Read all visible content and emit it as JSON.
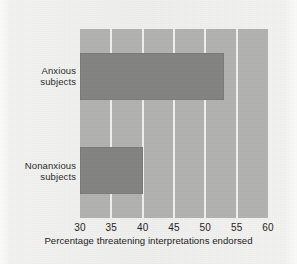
{
  "chart_data": {
    "type": "bar",
    "orientation": "horizontal",
    "title": "",
    "xlabel": "Percentage threatening interpretations endorsed",
    "ylabel": "",
    "categories": [
      "Anxious subjects",
      "Nonanxious subjects"
    ],
    "category_lines": [
      [
        "Anxious",
        "subjects"
      ],
      [
        "Nonanxious",
        "subjects"
      ]
    ],
    "values": [
      53,
      40
    ],
    "xlim": [
      30,
      60
    ],
    "xticks": [
      30,
      35,
      40,
      45,
      50,
      55,
      60
    ],
    "xtick_labels": [
      "30",
      "35",
      "40",
      "45",
      "50",
      "55",
      "60"
    ],
    "grid": "vertical",
    "legend": "none",
    "colors": {
      "page_background": "#efefee",
      "plot_background": "#b2b2b1",
      "bar": "#838382",
      "gridline": "#efefee",
      "text": "#232323"
    }
  }
}
